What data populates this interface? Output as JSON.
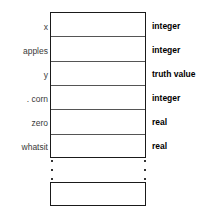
{
  "diagram": {
    "colors": {
      "background": "#ffffff",
      "box_border": "#1a1a1a",
      "row_divider": "#555555",
      "name_text": "#3a3a3a",
      "type_text": "#000000",
      "dot": "#333333"
    },
    "rows": [
      {
        "name": "x",
        "type": "integer"
      },
      {
        "name": "apples",
        "type": "integer"
      },
      {
        "name": "y",
        "type": "truth value"
      },
      {
        "name": ". corn",
        "type": "integer"
      },
      {
        "name": "zero",
        "type": "real"
      },
      {
        "name": "whatsit",
        "type": "real"
      }
    ],
    "ellipsis": {
      "dot_count": 3,
      "label": "continuation-ellipsis"
    },
    "bottom_box": {
      "label": "empty-trailing-entry",
      "name": "",
      "type": ""
    }
  }
}
